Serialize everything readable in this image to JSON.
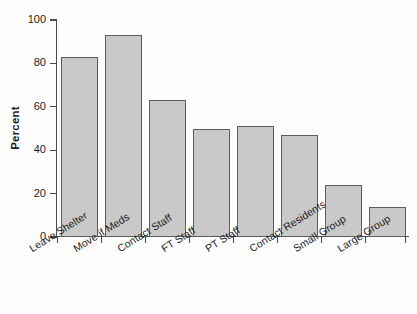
{
  "chart_data": {
    "type": "bar",
    "title": "",
    "xlabel": "",
    "ylabel": "Percent",
    "ylim": [
      0,
      100
    ],
    "yticks": [
      0,
      20,
      40,
      60,
      80,
      100
    ],
    "grid": false,
    "legend": null,
    "categories": [
      "Leave Shelter",
      "Move if Meds",
      "Contact Staff",
      "FT Staff",
      "PT Staff",
      "Contact Residents",
      "Small Group",
      "Large Group"
    ],
    "values": [
      83,
      93,
      63,
      50,
      51,
      47,
      24,
      14
    ],
    "bar_fill_color": "#c9c9c9",
    "bar_border_color": "#5d5d5d",
    "axis_color": "#4a4a4a",
    "background_color": "#fdfdfd"
  },
  "axis": {
    "ylabel": "Percent",
    "ytick_labels": [
      "0",
      "20",
      "40",
      "60",
      "80",
      "100"
    ]
  }
}
